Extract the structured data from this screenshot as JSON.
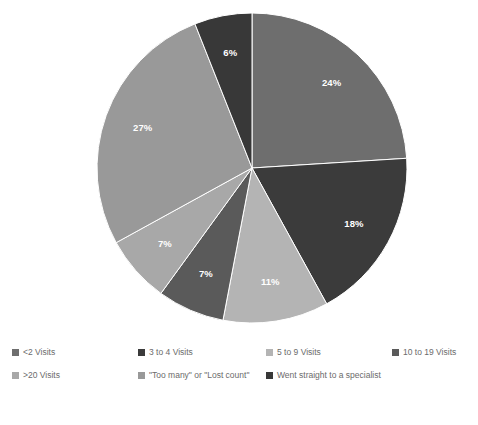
{
  "chart_data": {
    "type": "pie",
    "title": "",
    "subtitle": "",
    "xlabel": "",
    "ylabel": "",
    "grid": false,
    "legend_position": "bottom",
    "start_angle_deg": 0,
    "direction": "clockwise",
    "categories": [
      "<2 Visits",
      "3 to 4 Visits",
      "5 to 9 Visits",
      "10 to 19 Visits",
      ">20 Visits",
      "\"Too many\" or \"Lost count\"",
      "Went straight to a specialist"
    ],
    "values": [
      24,
      18,
      11,
      7,
      7,
      27,
      6
    ],
    "data_labels": [
      "24%",
      "18%",
      "11%",
      "7%",
      "7%",
      "27%",
      "6%"
    ],
    "colors": [
      "#6e6e6e",
      "#3b3b3b",
      "#b4b4b4",
      "#5a5a5a",
      "#a8a8a8",
      "#999999",
      "#383838"
    ],
    "label_color": "#ffffff"
  },
  "legend": {
    "row1": [
      {
        "label": "<2 Visits",
        "color": "#6e6e6e",
        "left": 12
      },
      {
        "label": "3 to 4 Visits",
        "color": "#3b3b3b",
        "left": 138
      },
      {
        "label": "5 to 9 Visits",
        "color": "#b4b4b4",
        "left": 266
      },
      {
        "label": "10 to 19 Visits",
        "color": "#5a5a5a",
        "left": 392
      }
    ],
    "row2": [
      {
        "label": ">20 Visits",
        "color": "#a8a8a8",
        "left": 12
      },
      {
        "label": "\"Too many\" or \"Lost count\"",
        "color": "#999999",
        "left": 138
      },
      {
        "label": "Went straight to a specialist",
        "color": "#383838",
        "left": 266
      }
    ]
  },
  "geometry": {
    "cx": 252,
    "cy": 168,
    "r": 155,
    "label_radius_factor": 0.75
  }
}
